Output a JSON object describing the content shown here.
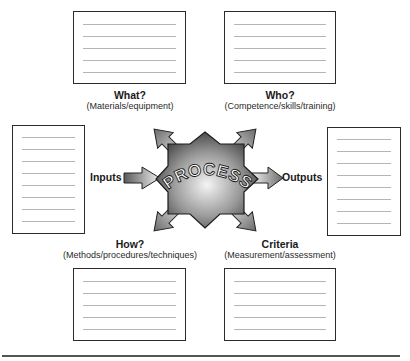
{
  "diagram": {
    "center": {
      "label": "PROCESS"
    },
    "quadrants": {
      "what": {
        "title": "What?",
        "subtitle": "(Materials/equipment)"
      },
      "who": {
        "title": "Who?",
        "subtitle": "(Competence/skills/training)"
      },
      "how": {
        "title": "How?",
        "subtitle": "(Methods/procedures/techniques)"
      },
      "criteria": {
        "title": "Criteria",
        "subtitle": "(Measurement/assessment)"
      }
    },
    "inputs": {
      "label": "Inputs"
    },
    "outputs": {
      "label": "Outputs"
    },
    "boxes": {
      "what": {
        "lines": 5
      },
      "who": {
        "lines": 5
      },
      "how": {
        "lines": 5
      },
      "criteria": {
        "lines": 5
      },
      "inputs": {
        "lines": 8
      },
      "outputs": {
        "lines": 8
      }
    },
    "colors": {
      "border": "#2b2b2b",
      "rule": "#b5b5b5",
      "shape_dark": "#3a3a3a",
      "shape_light": "#f2f2f2"
    }
  }
}
